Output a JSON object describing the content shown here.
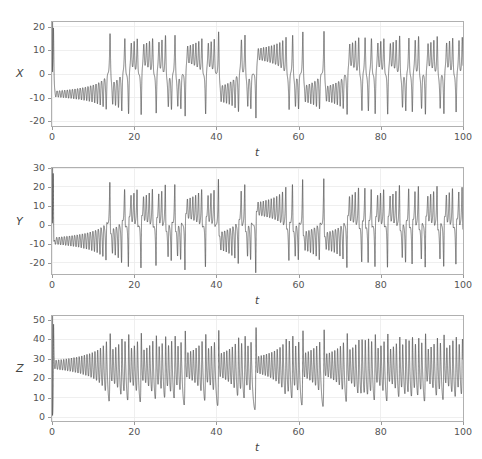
{
  "figure": {
    "title": "",
    "width": 482,
    "height": 459,
    "background": "#ffffff",
    "line_color": "#3b3b3b",
    "grid_color": "#ebebeb",
    "axis_color": "#b0b0b0",
    "tick_label_color": "#555555"
  },
  "chart_data": [
    {
      "type": "line",
      "title": "",
      "xlabel": "t",
      "ylabel": "X",
      "xlim": [
        0,
        100
      ],
      "ylim": [
        -22,
        22
      ],
      "xticks": [
        0,
        20,
        40,
        60,
        80,
        100
      ],
      "xtick_labels": [
        "0",
        "20",
        "40",
        "60",
        "80",
        "100"
      ],
      "yticks": [
        -20,
        -10,
        0,
        10,
        20
      ],
      "ytick_labels": [
        "-20",
        "-10",
        "0",
        "10",
        "20"
      ],
      "grid": true,
      "legend": "none",
      "series": [
        {
          "name": "X",
          "description": "Lorenz system x-component time series; starts near 20, collapses to about -8 with small slowly growing oscillations until t=18, then chaotic lobe switching with spikes reaching +18 and -19",
          "variable": "x"
        }
      ]
    },
    {
      "type": "line",
      "title": "",
      "xlabel": "t",
      "ylabel": "Y",
      "xlim": [
        -1,
        33
      ],
      "ylim": [
        -26,
        30
      ],
      "xticks": [
        0,
        20,
        40,
        60,
        80,
        100
      ],
      "xtick_labels": [
        "0",
        "20",
        "40",
        "60",
        "80",
        "100"
      ],
      "yticks": [
        -20,
        -10,
        0,
        10,
        20,
        30
      ],
      "ytick_labels": [
        "-20",
        "-10",
        "0",
        "10",
        "20",
        "30"
      ],
      "grid": true,
      "legend": "none",
      "series": [
        {
          "name": "Y",
          "description": "Lorenz system y-component time series; starts near 30, settles to about -9 with growing oscillations until t=18, then chaotic bursts with peaks near +25 and troughs near -24",
          "variable": "y"
        }
      ]
    },
    {
      "type": "line",
      "title": "",
      "xlabel": "t",
      "ylabel": "Z",
      "xlim": [
        0,
        100
      ],
      "ylim": [
        -2,
        52
      ],
      "xticks": [
        0,
        20,
        40,
        60,
        80,
        100
      ],
      "xtick_labels": [
        "0",
        "20",
        "40",
        "60",
        "80",
        "100"
      ],
      "yticks": [
        0,
        10,
        20,
        30,
        40,
        50
      ],
      "ytick_labels": [
        "0",
        "10",
        "20",
        "30",
        "40",
        "50"
      ],
      "grid": true,
      "legend": "none",
      "series": [
        {
          "name": "Z",
          "description": "Lorenz system z-component time series; starts near 52, settles to about 27 with growing oscillations until t=18, then chaotic oscillations between about 5 and 47",
          "variable": "z"
        }
      ]
    }
  ],
  "model": {
    "name": "lorenz",
    "sigma": 10,
    "rho": 28,
    "beta": 2.6666666667,
    "x0": 1.0,
    "y0": 1.0,
    "z0": 1.0,
    "t_start": 0,
    "t_end": 100,
    "dt": 0.002
  },
  "panels": [
    {
      "id": "panel-x",
      "top": 21,
      "plot_left": 51,
      "plot_top": 21,
      "plot_width": 413,
      "plot_height": 106,
      "ylabel_left": 16,
      "ylabel_top": 68
    },
    {
      "id": "panel-y",
      "top": 167,
      "plot_left": 51,
      "plot_top": 167,
      "plot_width": 413,
      "plot_height": 108,
      "ylabel_left": 16,
      "ylabel_top": 216
    },
    {
      "id": "panel-z",
      "top": 315,
      "plot_left": 51,
      "plot_top": 315,
      "plot_width": 413,
      "plot_height": 107,
      "ylabel_left": 16,
      "ylabel_top": 363
    }
  ]
}
